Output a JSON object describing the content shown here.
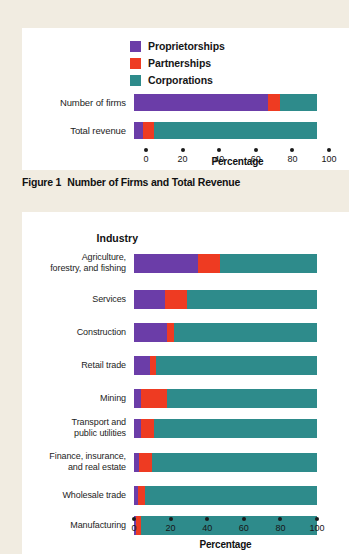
{
  "colors": {
    "proprietorships": "#6B3DA8",
    "partnerships": "#EE3B22",
    "corporations": "#2E8B8B",
    "page_background": "#F1ECE1",
    "panel_background": "#FFFFFF",
    "rule": "#CFCABD",
    "text": "#1A1A1A"
  },
  "figure1": {
    "caption_number": "Figure 1",
    "caption_text": "Number of Firms and Total Revenue",
    "legend": [
      {
        "label": "Proprietorships",
        "color": "#6B3DA8",
        "swatch_name": "legend-swatch-proprietorships"
      },
      {
        "label": "Partnerships",
        "color": "#EE3B22",
        "swatch_name": "legend-swatch-partnerships"
      },
      {
        "label": "Corporations",
        "color": "#2E8B8B",
        "swatch_name": "legend-swatch-corporations"
      }
    ],
    "axis_title": "Percentage",
    "ticks": [
      "0",
      "20",
      "40",
      "60",
      "80",
      "100"
    ]
  },
  "figure2": {
    "heading": "Industry",
    "axis_title": "Percentage",
    "ticks": [
      "0",
      "20",
      "40",
      "60",
      "80",
      "100"
    ]
  },
  "chart_data": [
    {
      "type": "bar",
      "orientation": "horizontal",
      "stacked": true,
      "normalized_percent": true,
      "title": "Figure 1  Number of Firms and Total Revenue",
      "xlabel": "Percentage",
      "ylabel": "",
      "xlim": [
        0,
        100
      ],
      "xticks": [
        0,
        20,
        40,
        60,
        80,
        100
      ],
      "grid": false,
      "legend": [
        "Proprietorships",
        "Partnerships",
        "Corporations"
      ],
      "legend_position": "top-center",
      "categories": [
        "Number of firms",
        "Total revenue"
      ],
      "series": [
        {
          "name": "Proprietorships",
          "color": "#6B3DA8",
          "values": [
            73,
            5
          ]
        },
        {
          "name": "Partnerships",
          "color": "#EE3B22",
          "values": [
            7,
            6
          ]
        },
        {
          "name": "Corporations",
          "color": "#2E8B8B",
          "values": [
            20,
            89
          ]
        }
      ]
    },
    {
      "type": "bar",
      "orientation": "horizontal",
      "stacked": true,
      "normalized_percent": true,
      "title": "Industry",
      "xlabel": "Percentage",
      "ylabel": "Industry",
      "xlim": [
        0,
        100
      ],
      "xticks": [
        0,
        20,
        40,
        60,
        80,
        100
      ],
      "grid": false,
      "legend": [
        "Proprietorships",
        "Partnerships",
        "Corporations"
      ],
      "legend_position": "none",
      "categories": [
        "Agriculture, forestry, and fishing",
        "Services",
        "Construction",
        "Retail trade",
        "Mining",
        "Transport and public utilities",
        "Finance, insurance, and real estate",
        "Wholesale trade",
        "Manufacturing"
      ],
      "series": [
        {
          "name": "Proprietorships",
          "color": "#6B3DA8",
          "values": [
            35,
            17,
            18,
            9,
            4,
            4,
            3,
            2,
            1
          ]
        },
        {
          "name": "Partnerships",
          "color": "#EE3B22",
          "values": [
            12,
            12,
            4,
            3,
            14,
            7,
            7,
            4,
            3
          ]
        },
        {
          "name": "Corporations",
          "color": "#2E8B8B",
          "values": [
            53,
            71,
            78,
            88,
            82,
            89,
            90,
            94,
            96
          ]
        }
      ]
    }
  ],
  "figure2_rows": [
    {
      "label_lines": [
        "Agriculture,",
        "forestry, and fishing"
      ]
    },
    {
      "label_lines": [
        "Services"
      ]
    },
    {
      "label_lines": [
        "Construction"
      ]
    },
    {
      "label_lines": [
        "Retail trade"
      ]
    },
    {
      "label_lines": [
        "Mining"
      ]
    },
    {
      "label_lines": [
        "Transport and",
        "public utilities"
      ]
    },
    {
      "label_lines": [
        "Finance, insurance,",
        "and real estate"
      ]
    },
    {
      "label_lines": [
        "Wholesale trade"
      ]
    },
    {
      "label_lines": [
        "Manufacturing"
      ]
    }
  ]
}
